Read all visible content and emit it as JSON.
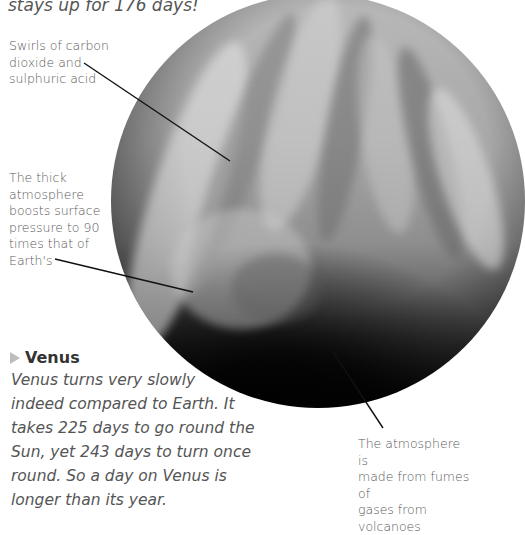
{
  "intro": {
    "tail_text": "stays up for 176 days!"
  },
  "planet": {
    "name": "Venus",
    "image_description": "grayscale-venus-cloud-swirls"
  },
  "annotations": [
    {
      "id": "swirls",
      "lines": [
        "Swirls of carbon",
        "dioxide and",
        "sulphuric acid"
      ]
    },
    {
      "id": "pressure",
      "lines": [
        "The thick",
        "atmosphere",
        "boosts surface",
        "pressure to 90",
        "times that of",
        "Earth's"
      ]
    },
    {
      "id": "fumes",
      "lines": [
        "The atmosphere is",
        "made from fumes of",
        "gases from volcanoes"
      ]
    }
  ],
  "section": {
    "icon": "triangle-right-icon",
    "title": "Venus",
    "body_lines": [
      "Venus turns very slowly",
      "indeed compared to Earth. It",
      "takes 225 days to go round the",
      "Sun, yet 243 days to turn once",
      "round. So a day on Venus is",
      "longer than its year."
    ]
  },
  "colors": {
    "label_text": "#5a5a5a",
    "title_text": "#333333",
    "arrow": "#bdbdbd",
    "leader_line": "#111111"
  }
}
